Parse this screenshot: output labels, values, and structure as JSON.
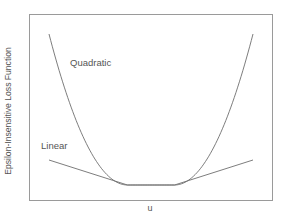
{
  "chart_data": {
    "type": "line",
    "title": "",
    "xlabel": "u",
    "ylabel": "Epsilon-Insensitive Loss Function",
    "grid": false,
    "ticks": false,
    "legend": "inline labels",
    "xlim": [
      -3,
      3
    ],
    "ylim": [
      0,
      4.5
    ],
    "epsilon": 0.6,
    "series": [
      {
        "name": "Quadratic",
        "formula": "max(0, |u| - epsilon)^2",
        "x": [
          -2.6,
          -2.0,
          -1.5,
          -1.0,
          -0.6,
          0.0,
          0.6,
          1.0,
          1.5,
          2.0,
          2.6
        ],
        "y": [
          4.0,
          1.96,
          0.81,
          0.16,
          0.0,
          0.0,
          0.0,
          0.16,
          0.81,
          1.96,
          4.0
        ]
      },
      {
        "name": "Linear",
        "formula": "max(0, |u| - epsilon)",
        "x": [
          -2.6,
          -0.6,
          0.0,
          0.6,
          2.6
        ],
        "y": [
          0.55,
          0.0,
          0.0,
          0.0,
          0.55
        ]
      }
    ],
    "annotations": [
      {
        "text": "Quadratic",
        "near": "upper-left, right of quadratic curve"
      },
      {
        "text": "Linear",
        "near": "left, above linear curve"
      }
    ]
  },
  "labels": {
    "quadratic": "Quadratic",
    "linear": "Linear",
    "xlabel": "u",
    "ylabel": "Epsilon-Insensitive Loss Function"
  },
  "colors": {
    "frame": "#9a9a9a",
    "curve": "#6e6e6e",
    "text": "#555555"
  }
}
